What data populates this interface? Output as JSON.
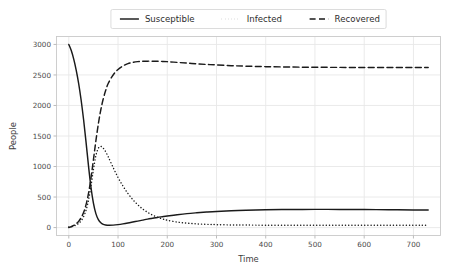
{
  "chart_data": {
    "type": "line",
    "title": "",
    "xlabel": "Time",
    "ylabel": "People",
    "xlim": [
      -25,
      755
    ],
    "ylim": [
      -130,
      3130
    ],
    "xticks": [
      0,
      100,
      200,
      300,
      400,
      500,
      600,
      700
    ],
    "yticks": [
      0,
      500,
      1000,
      1500,
      2000,
      2500,
      3000
    ],
    "xtick_labels": [
      "0",
      "100",
      "200",
      "300",
      "400",
      "500",
      "600",
      "700"
    ],
    "ytick_labels": [
      "0",
      "500",
      "1000",
      "1500",
      "2000",
      "2500",
      "3000"
    ],
    "grid": true,
    "legend_position": "upper center outside",
    "background": "#ffffff",
    "line_color": "#1a1a1a",
    "grid_color": "#e8e8e8",
    "x": [
      0,
      5,
      10,
      15,
      20,
      25,
      30,
      35,
      40,
      45,
      50,
      55,
      60,
      65,
      70,
      75,
      80,
      90,
      100,
      110,
      120,
      130,
      140,
      150,
      160,
      170,
      180,
      190,
      200,
      220,
      240,
      260,
      280,
      300,
      330,
      360,
      400,
      450,
      500,
      550,
      600,
      650,
      700,
      730
    ],
    "series": [
      {
        "name": "Susceptible",
        "style": "solid",
        "values": [
          3000,
          2900,
          2760,
          2580,
          2360,
          2090,
          1770,
          1400,
          1010,
          660,
          400,
          228,
          130,
          78,
          52,
          42,
          38,
          40,
          48,
          60,
          74,
          90,
          106,
          122,
          138,
          152,
          166,
          178,
          190,
          210,
          228,
          242,
          254,
          264,
          276,
          284,
          291,
          296,
          298,
          297,
          295,
          292,
          289,
          288
        ]
      },
      {
        "name": "Infected",
        "style": "dotted",
        "values": [
          10,
          16,
          26,
          42,
          68,
          110,
          178,
          285,
          450,
          680,
          950,
          1180,
          1300,
          1330,
          1300,
          1240,
          1160,
          985,
          820,
          680,
          560,
          458,
          374,
          305,
          250,
          205,
          170,
          142,
          120,
          90,
          72,
          60,
          53,
          48,
          43,
          41,
          39,
          38,
          38,
          38,
          38,
          38,
          38,
          38
        ]
      },
      {
        "name": "Recovered",
        "style": "dashed",
        "values": [
          0,
          14,
          34,
          62,
          102,
          160,
          245,
          375,
          560,
          810,
          1110,
          1420,
          1700,
          1930,
          2110,
          2250,
          2360,
          2500,
          2590,
          2648,
          2685,
          2706,
          2718,
          2724,
          2726,
          2726,
          2724,
          2722,
          2718,
          2706,
          2694,
          2682,
          2672,
          2664,
          2652,
          2644,
          2636,
          2630,
          2626,
          2624,
          2623,
          2622,
          2622,
          2622
        ]
      }
    ]
  },
  "legend": {
    "items": [
      {
        "label": "Susceptible",
        "style": "solid"
      },
      {
        "label": "Infected",
        "style": "dotted"
      },
      {
        "label": "Recovered",
        "style": "dashed"
      }
    ]
  }
}
